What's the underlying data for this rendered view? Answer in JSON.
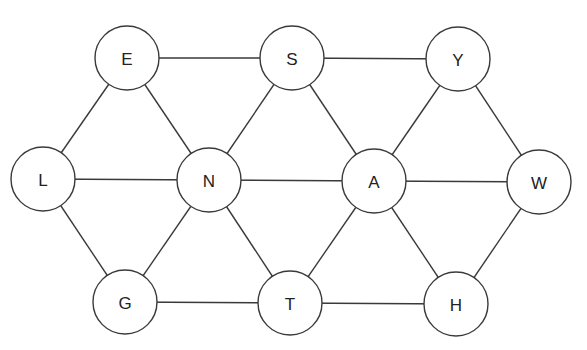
{
  "diagram": {
    "type": "graph",
    "node_radius": 32,
    "colors": {
      "stroke": "#3a3a3a",
      "fill": "#ffffff",
      "text": "#222222"
    },
    "nodes": [
      {
        "id": "E",
        "label": "E",
        "x": 127,
        "y": 58
      },
      {
        "id": "S",
        "label": "S",
        "x": 292,
        "y": 58
      },
      {
        "id": "Y",
        "label": "Y",
        "x": 458,
        "y": 59
      },
      {
        "id": "L",
        "label": "L",
        "x": 43,
        "y": 179
      },
      {
        "id": "N",
        "label": "N",
        "x": 209,
        "y": 180
      },
      {
        "id": "A",
        "label": "A",
        "x": 374,
        "y": 181
      },
      {
        "id": "W",
        "label": "W",
        "x": 539,
        "y": 182
      },
      {
        "id": "G",
        "label": "G",
        "x": 125,
        "y": 302
      },
      {
        "id": "T",
        "label": "T",
        "x": 290,
        "y": 303
      },
      {
        "id": "H",
        "label": "H",
        "x": 456,
        "y": 304
      }
    ],
    "edges": [
      [
        "E",
        "S"
      ],
      [
        "S",
        "Y"
      ],
      [
        "E",
        "L"
      ],
      [
        "E",
        "N"
      ],
      [
        "S",
        "N"
      ],
      [
        "S",
        "A"
      ],
      [
        "Y",
        "A"
      ],
      [
        "Y",
        "W"
      ],
      [
        "L",
        "N"
      ],
      [
        "N",
        "A"
      ],
      [
        "A",
        "W"
      ],
      [
        "L",
        "G"
      ],
      [
        "N",
        "G"
      ],
      [
        "N",
        "T"
      ],
      [
        "A",
        "T"
      ],
      [
        "A",
        "H"
      ],
      [
        "W",
        "H"
      ],
      [
        "G",
        "T"
      ],
      [
        "T",
        "H"
      ]
    ]
  }
}
